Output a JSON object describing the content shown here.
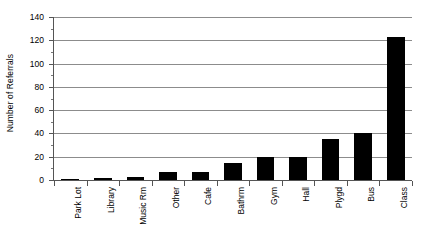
{
  "chart_data": {
    "type": "bar",
    "title": "",
    "subtitle": "",
    "xlabel": "",
    "ylabel": "Number of Referrals",
    "categories": [
      "Park Lot",
      "Library",
      "Music Rm",
      "Other",
      "Cafe",
      "Bathrm",
      "Gym",
      "Hall",
      "Plygd",
      "Bus",
      "Class"
    ],
    "values": [
      1,
      2,
      3,
      7,
      7,
      15,
      20,
      20,
      35,
      40,
      123
    ],
    "ylim": [
      0,
      140
    ],
    "ytick_labels": [
      "0",
      "20",
      "40",
      "60",
      "80",
      "100",
      "120",
      "140"
    ],
    "ytick_values": [
      0,
      20,
      40,
      60,
      80,
      100,
      120,
      140
    ],
    "grid": "horizontal",
    "legend": "none",
    "bar_color": "#000000",
    "gridline_color": "#8c8c8c",
    "axis_color": "#555555",
    "background_color": "#ffffff"
  }
}
